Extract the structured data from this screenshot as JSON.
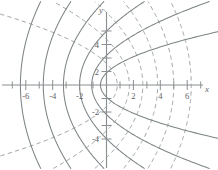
{
  "figure": {
    "title": "",
    "axis_labels": {
      "x": "x",
      "y": "y"
    },
    "colors": {
      "axis": "#8a8f91",
      "solid_curve": "#7e8486",
      "dashed_curve": "#9aa0a2",
      "tick_label": "#5d6163",
      "background": "#ffffff"
    }
  },
  "chart_data": {
    "type": "line",
    "title": "",
    "subtitle": "",
    "xlabel": "x",
    "ylabel": "y",
    "xlim": [
      -7.6,
      7.6
    ],
    "ylim": [
      -5.6,
      5.6
    ],
    "grid": false,
    "legend": null,
    "xticks": [
      -6,
      -4,
      -2,
      2,
      4,
      6
    ],
    "xtick_labels": [
      "-6",
      "-4",
      "-2",
      "2",
      "4",
      "6"
    ],
    "yticks": [
      -4,
      -2,
      2,
      4
    ],
    "ytick_labels": [
      "-4",
      "-2",
      "2",
      "4"
    ],
    "minor_xticks": [
      -7,
      -5,
      -3,
      -1,
      1,
      3,
      5,
      7
    ],
    "minor_yticks": [
      -5,
      -3,
      -1,
      1,
      3,
      5
    ],
    "series": [
      {
        "name": "left-opening parabolas (dashed)",
        "style": "dashed",
        "equation": "x = a - y^2/(4a)",
        "vertices_on_x_axis": [
          0.8,
          1.7,
          2.7,
          3.8,
          5.0,
          6.3
        ],
        "count": 6
      },
      {
        "name": "right-opening parabolas (solid)",
        "style": "solid",
        "equation": "x = -b + y^2/(4b)",
        "vertices_on_x_axis": [
          -0.45,
          -1.1,
          -2.0,
          -3.2,
          -4.7,
          -6.4
        ],
        "count": 6
      }
    ]
  }
}
